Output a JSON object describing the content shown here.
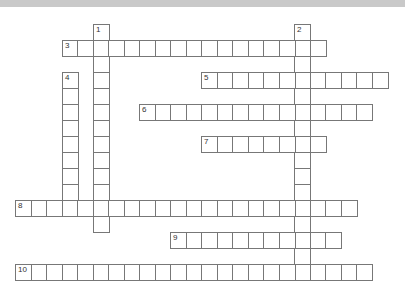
{
  "puzzle": {
    "type": "crossword",
    "grid": {
      "origin_x": 15,
      "origin_y": 24,
      "cell_w": 15.5,
      "cell_h": 16
    },
    "colors": {
      "banner": "#c9c9c9",
      "cell_border": "#777777",
      "cell_fill": "#ffffff",
      "number_text": "#333333"
    },
    "entries": [
      {
        "number": "1",
        "direction": "down",
        "col": 5,
        "row": 0,
        "length": 13
      },
      {
        "number": "2",
        "direction": "down",
        "col": 18,
        "row": 0,
        "length": 16
      },
      {
        "number": "3",
        "direction": "across",
        "col": 3,
        "row": 1,
        "length": 17
      },
      {
        "number": "4",
        "direction": "down",
        "col": 3,
        "row": 3,
        "length": 9
      },
      {
        "number": "5",
        "direction": "across",
        "col": 12,
        "row": 3,
        "length": 12
      },
      {
        "number": "6",
        "direction": "across",
        "col": 8,
        "row": 5,
        "length": 15
      },
      {
        "number": "7",
        "direction": "across",
        "col": 12,
        "row": 7,
        "length": 8
      },
      {
        "number": "8",
        "direction": "across",
        "col": 0,
        "row": 11,
        "length": 22
      },
      {
        "number": "9",
        "direction": "across",
        "col": 10,
        "row": 13,
        "length": 11
      },
      {
        "number": "10",
        "direction": "across",
        "col": 0,
        "row": 15,
        "length": 23
      }
    ]
  }
}
